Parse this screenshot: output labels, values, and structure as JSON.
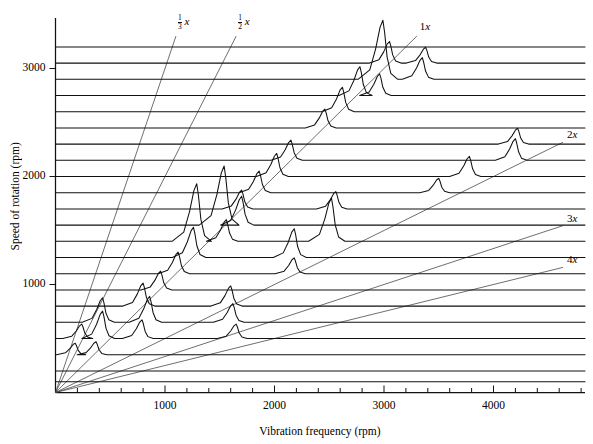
{
  "figure": {
    "type": "waterfall-cascade-spectral-map",
    "title": "",
    "x_axis_title": "Vibration frequency (rpm)",
    "y_axis_title": "Speed of rotation (rpm)"
  },
  "chart_data": {
    "type": "line",
    "title": "",
    "xlabel": "Vibration frequency (rpm)",
    "ylabel": "Speed of rotation (rpm)",
    "xlim": [
      0,
      4900
    ],
    "ylim": [
      0,
      3400
    ],
    "grid": false,
    "legend_position": "inline-right",
    "x_ticks_major": [
      1000,
      2000,
      3000,
      4000
    ],
    "x_ticks_minor_step": 200,
    "y_ticks_major": [
      1000,
      2000,
      3000
    ],
    "x_tick_labels": [
      "1000",
      "2000",
      "3000",
      "4000"
    ],
    "y_tick_labels": [
      "1000",
      "2000",
      "3000"
    ],
    "order_lines": [
      {
        "label": "1/3 x",
        "label_numerator": "1",
        "label_denominator": "3",
        "label_suffix": "x",
        "slope_order": 0.3333
      },
      {
        "label": "1/2 x",
        "label_numerator": "1",
        "label_denominator": "2",
        "label_suffix": "x",
        "slope_order": 0.5
      },
      {
        "label": "1x",
        "slope_order": 1
      },
      {
        "label": "2x",
        "slope_order": 2
      },
      {
        "label": "3x",
        "slope_order": 3
      },
      {
        "label": "4x",
        "slope_order": 4
      }
    ],
    "series": [
      {
        "name": "spectrum-3200",
        "rpm": 3200,
        "peaks": []
      },
      {
        "name": "spectrum-3050",
        "rpm": 3050,
        "peaks": [
          {
            "freq": 3050,
            "amp": 0.3
          },
          {
            "freq": 3380,
            "amp": 0.22
          }
        ]
      },
      {
        "name": "spectrum-2900",
        "rpm": 2900,
        "peaks": [
          {
            "freq": 2990,
            "amp": 0.82
          },
          {
            "freq": 3350,
            "amp": 0.3
          }
        ]
      },
      {
        "name": "spectrum-2750",
        "rpm": 2750,
        "peaks": [
          {
            "freq": 2780,
            "amp": 0.4
          },
          {
            "freq": 2960,
            "amp": 0.3
          }
        ]
      },
      {
        "name": "spectrum-2600",
        "rpm": 2600,
        "peaks": [
          {
            "freq": 2620,
            "amp": 0.34
          }
        ]
      },
      {
        "name": "spectrum-2450",
        "rpm": 2450,
        "peaks": [
          {
            "freq": 2460,
            "amp": 0.26
          }
        ]
      },
      {
        "name": "spectrum-2300",
        "rpm": 2300,
        "peaks": [
          {
            "freq": 4220,
            "amp": 0.22
          }
        ]
      },
      {
        "name": "spectrum-2150",
        "rpm": 2150,
        "peaks": [
          {
            "freq": 2150,
            "amp": 0.28
          },
          {
            "freq": 4200,
            "amp": 0.3
          }
        ]
      },
      {
        "name": "spectrum-2000",
        "rpm": 2000,
        "peaks": [
          {
            "freq": 2020,
            "amp": 0.32
          },
          {
            "freq": 3780,
            "amp": 0.28
          }
        ]
      },
      {
        "name": "spectrum-1850",
        "rpm": 1850,
        "peaks": [
          {
            "freq": 1860,
            "amp": 0.3
          },
          {
            "freq": 3500,
            "amp": 0.2
          }
        ]
      },
      {
        "name": "spectrum-1700",
        "rpm": 1700,
        "peaks": [
          {
            "freq": 1700,
            "amp": 0.26
          },
          {
            "freq": 2560,
            "amp": 0.24
          }
        ]
      },
      {
        "name": "spectrum-1550",
        "rpm": 1550,
        "peaks": [
          {
            "freq": 1540,
            "amp": 0.82
          },
          {
            "freq": 1700,
            "amp": 0.4
          }
        ]
      },
      {
        "name": "spectrum-1400",
        "rpm": 1400,
        "peaks": [
          {
            "freq": 1290,
            "amp": 0.8
          },
          {
            "freq": 1560,
            "amp": 0.3
          },
          {
            "freq": 2520,
            "amp": 0.6
          }
        ]
      },
      {
        "name": "spectrum-1250",
        "rpm": 1250,
        "peaks": [
          {
            "freq": 1260,
            "amp": 0.42
          },
          {
            "freq": 2180,
            "amp": 0.4
          }
        ]
      },
      {
        "name": "spectrum-1100",
        "rpm": 1100,
        "peaks": [
          {
            "freq": 1120,
            "amp": 0.3
          },
          {
            "freq": 2180,
            "amp": 0.22
          }
        ]
      },
      {
        "name": "spectrum-950",
        "rpm": 950,
        "peaks": [
          {
            "freq": 960,
            "amp": 0.26
          }
        ]
      },
      {
        "name": "spectrum-800",
        "rpm": 800,
        "peaks": [
          {
            "freq": 800,
            "amp": 0.32
          },
          {
            "freq": 1600,
            "amp": 0.28
          }
        ]
      },
      {
        "name": "spectrum-650",
        "rpm": 650,
        "peaks": [
          {
            "freq": 430,
            "amp": 0.34
          },
          {
            "freq": 860,
            "amp": 0.36
          },
          {
            "freq": 1620,
            "amp": 0.26
          }
        ]
      },
      {
        "name": "spectrum-500",
        "rpm": 500,
        "peaks": [
          {
            "freq": 240,
            "amp": 0.2
          },
          {
            "freq": 430,
            "amp": 0.38
          },
          {
            "freq": 790,
            "amp": 0.26
          },
          {
            "freq": 1650,
            "amp": 0.2
          }
        ]
      },
      {
        "name": "spectrum-350",
        "rpm": 350,
        "peaks": [
          {
            "freq": 180,
            "amp": 0.16
          },
          {
            "freq": 370,
            "amp": 0.18
          }
        ]
      },
      {
        "name": "spectrum-200",
        "rpm": 200,
        "peaks": []
      },
      {
        "name": "spectrum-100",
        "rpm": 100,
        "peaks": []
      }
    ]
  }
}
